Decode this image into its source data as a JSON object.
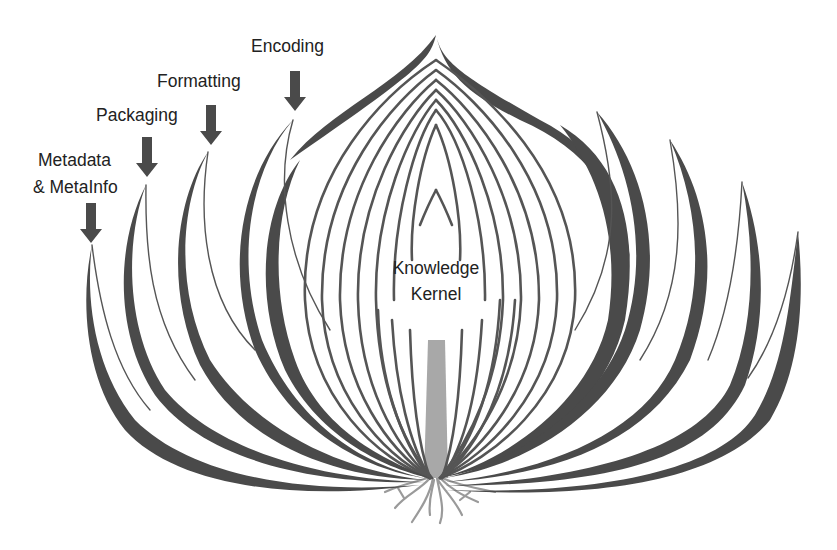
{
  "diagram": {
    "colors": {
      "background": "#ffffff",
      "layer_dark": "#4a4a4a",
      "layer_line": "#555555",
      "stem": "#a8a8a8",
      "roots": "#9a9a9a",
      "arrow": "#4a4a4a",
      "text": "#222222"
    },
    "labels": {
      "encoding": "Encoding",
      "formatting": "Formatting",
      "packaging": "Packaging",
      "metadata_line1": "Metadata",
      "metadata_line2": "& MetaInfo",
      "kernel_line1": "Knowledge",
      "kernel_line2": "Kernel"
    },
    "layers_outer_to_inner": [
      "Metadata & MetaInfo",
      "Packaging",
      "Formatting",
      "Encoding",
      "Knowledge Kernel"
    ],
    "icons": {
      "arrow": "down-arrow-icon"
    }
  }
}
